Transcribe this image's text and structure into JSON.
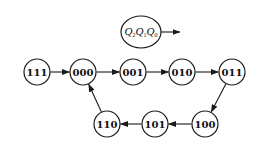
{
  "legend": {
    "variables": [
      {
        "letter": "Q",
        "sub": "2"
      },
      {
        "letter": "Q",
        "sub": "1"
      },
      {
        "letter": "Q",
        "sub": "0"
      }
    ],
    "center": [
      141,
      32
    ],
    "rx": 20,
    "ry": 16,
    "arrow_to": [
      180,
      32
    ]
  },
  "node_radius": 13,
  "nodes": [
    {
      "id": "111",
      "label": "111",
      "cx": 37,
      "cy": 72
    },
    {
      "id": "000",
      "label": "000",
      "cx": 83,
      "cy": 72
    },
    {
      "id": "001",
      "label": "001",
      "cx": 133,
      "cy": 72
    },
    {
      "id": "010",
      "label": "010",
      "cx": 182,
      "cy": 72
    },
    {
      "id": "011",
      "label": "011",
      "cx": 232,
      "cy": 72
    },
    {
      "id": "100",
      "label": "100",
      "cx": 205,
      "cy": 124
    },
    {
      "id": "101",
      "label": "101",
      "cx": 155,
      "cy": 124
    },
    {
      "id": "110",
      "label": "110",
      "cx": 107,
      "cy": 124
    }
  ],
  "edges": [
    {
      "from": "111",
      "to": "000"
    },
    {
      "from": "000",
      "to": "001"
    },
    {
      "from": "001",
      "to": "010"
    },
    {
      "from": "010",
      "to": "011"
    },
    {
      "from": "011",
      "to": "100"
    },
    {
      "from": "100",
      "to": "101"
    },
    {
      "from": "101",
      "to": "110"
    },
    {
      "from": "110",
      "to": "000"
    }
  ],
  "colors": {
    "stroke": "#1a1a1a",
    "background": "#ffffff"
  }
}
